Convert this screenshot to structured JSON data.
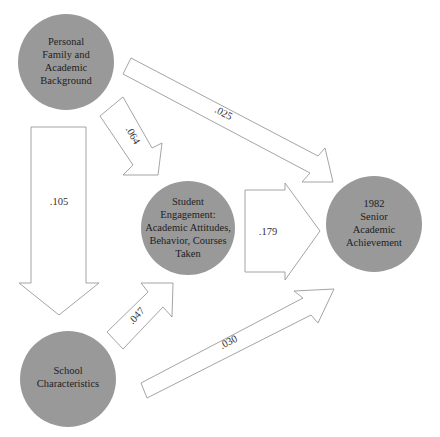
{
  "colors": {
    "node_fill": "#999999",
    "arrow_stroke": "#9a9a9a",
    "arrow_fill": "#ffffff",
    "text": "#1e1e1e"
  },
  "nodes": {
    "background": {
      "lines": [
        "Personal",
        "Family and",
        "Academic",
        "Background"
      ]
    },
    "school": {
      "lines": [
        "School",
        "Characteristics"
      ]
    },
    "engagement": {
      "lines": [
        "Student",
        "Engagement:",
        "Academic Attitudes,",
        "Behavior, Courses",
        "Taken"
      ]
    },
    "achievement": {
      "lines": [
        "1982",
        "Senior",
        "Academic",
        "Achievement"
      ]
    }
  },
  "paths": {
    "background_to_school": {
      "from": "Personal Family and Academic Background",
      "to": "School Characteristics",
      "coefficient": ".105"
    },
    "background_to_engagement": {
      "from": "Personal Family and Academic Background",
      "to": "Student Engagement",
      "coefficient": ".064"
    },
    "background_to_achievement": {
      "from": "Personal Family and Academic Background",
      "to": "1982 Senior Academic Achievement",
      "coefficient": ".025"
    },
    "school_to_engagement": {
      "from": "School Characteristics",
      "to": "Student Engagement",
      "coefficient": ".047"
    },
    "school_to_achievement": {
      "from": "School Characteristics",
      "to": "1982 Senior Academic Achievement",
      "coefficient": ".030"
    },
    "engagement_to_achievement": {
      "from": "Student Engagement",
      "to": "1982 Senior Academic Achievement",
      "coefficient": ".179"
    }
  }
}
